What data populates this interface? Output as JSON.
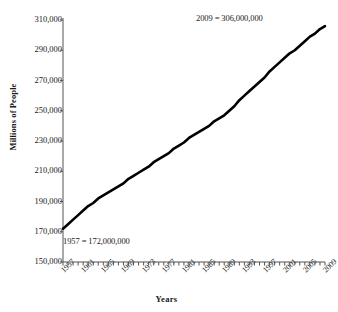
{
  "chart_data": {
    "type": "line",
    "title": "",
    "xlabel": "Years",
    "ylabel": "Millions of People",
    "xlim": [
      1957,
      2009
    ],
    "ylim": [
      150000,
      310000
    ],
    "grid": false,
    "legend": "none",
    "y_ticks": [
      "150,000",
      "170,000",
      "190,000",
      "210,000",
      "230,000",
      "250,000",
      "270,000",
      "290,000",
      "310,000"
    ],
    "y_tick_values": [
      150000,
      170000,
      190000,
      210000,
      230000,
      250000,
      270000,
      290000,
      310000
    ],
    "x_ticks": [
      "1957",
      "1961",
      "1965",
      "1969",
      "1973",
      "1977",
      "1981",
      "1985",
      "1989",
      "1993",
      "1997",
      "2001",
      "2005",
      "2009"
    ],
    "x_tick_values": [
      1957,
      1961,
      1965,
      1969,
      1973,
      1977,
      1981,
      1985,
      1989,
      1993,
      1997,
      2001,
      2005,
      2009
    ],
    "annotations": [
      {
        "text": "2009 = 306,000,000",
        "x": 2009,
        "y": 306000
      },
      {
        "text": "1957 = 172,000,000",
        "x": 1957,
        "y": 172000
      }
    ],
    "series": [
      {
        "name": "US Population",
        "color": "#000000",
        "x": [
          1957,
          1958,
          1959,
          1960,
          1961,
          1962,
          1963,
          1964,
          1965,
          1966,
          1967,
          1968,
          1969,
          1970,
          1971,
          1972,
          1973,
          1974,
          1975,
          1976,
          1977,
          1978,
          1979,
          1980,
          1981,
          1982,
          1983,
          1984,
          1985,
          1986,
          1987,
          1988,
          1989,
          1990,
          1991,
          1992,
          1993,
          1994,
          1995,
          1996,
          1997,
          1998,
          1999,
          2000,
          2001,
          2002,
          2003,
          2004,
          2005,
          2006,
          2007,
          2008,
          2009
        ],
        "values": [
          172000,
          175000,
          178000,
          181000,
          184000,
          187000,
          189000,
          192000,
          194000,
          196000,
          198000,
          200000,
          202000,
          205000,
          207000,
          209000,
          211000,
          213000,
          216000,
          218000,
          220000,
          222000,
          225000,
          227000,
          229000,
          232000,
          234000,
          236000,
          238000,
          240000,
          243000,
          245000,
          247000,
          250000,
          253000,
          257000,
          260000,
          263000,
          266000,
          269000,
          272000,
          276000,
          279000,
          282000,
          285000,
          288000,
          290000,
          293000,
          296000,
          299000,
          301000,
          304000,
          306000
        ]
      }
    ]
  },
  "axis": {
    "y_title": "Millions of People",
    "x_title": "Years"
  }
}
